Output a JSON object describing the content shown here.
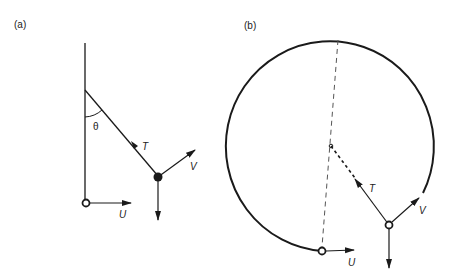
{
  "figure": {
    "panel_a": {
      "label": "(a)",
      "angle_label": "θ",
      "tension_label": "T",
      "velocity_label": "V",
      "pivot_velocity_label": "U",
      "description": "Pendulum: vertical rod with moving pivot (open circle, velocity U), string at angle θ to the vertical, bob (filled circle) with tension T, velocity V and weight downward"
    },
    "panel_b": {
      "label": "(b)",
      "tension_label": "T",
      "velocity_label": "V",
      "pivot_velocity_label": "U",
      "description": "Circular path of bob about centre; dashed diameter through centre, dashed string from centre towards bob (open circle) with tension T, velocity V tangential, weight downward; starting point open circle with velocity U"
    },
    "colors": {
      "stroke": "#1a1a1a",
      "dashed": "#555555",
      "background": "#ffffff"
    }
  }
}
